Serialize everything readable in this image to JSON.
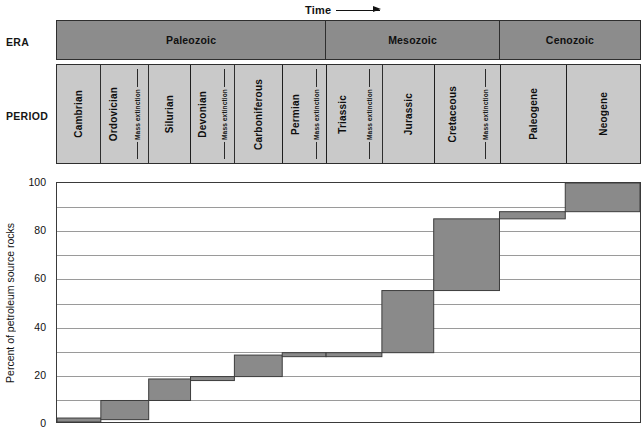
{
  "time_arrow": {
    "label": "Time",
    "icon": "right-arrow-icon"
  },
  "rows": {
    "era_label": "ERA",
    "period_label": "PERIOD"
  },
  "eras": [
    {
      "name": "Paleozoic",
      "span": 6
    },
    {
      "name": "Mesozoic",
      "span": 3
    },
    {
      "name": "Cenozoic",
      "span": 2
    }
  ],
  "periods": [
    {
      "name": "Cambrian",
      "mass_extinction": false
    },
    {
      "name": "Ordovician",
      "mass_extinction": true
    },
    {
      "name": "Silurian",
      "mass_extinction": false
    },
    {
      "name": "Devonian",
      "mass_extinction": true
    },
    {
      "name": "Carboniferous",
      "mass_extinction": false
    },
    {
      "name": "Permian",
      "mass_extinction": true
    },
    {
      "name": "Triassic",
      "mass_extinction": true
    },
    {
      "name": "Jurassic",
      "mass_extinction": false
    },
    {
      "name": "Cretaceous",
      "mass_extinction": true
    },
    {
      "name": "Paleogene",
      "mass_extinction": false
    },
    {
      "name": "Neogene",
      "mass_extinction": false
    }
  ],
  "mass_extinction_label": "Mass extinction",
  "colors": {
    "era_band": "#8c8c8c",
    "period_band": "#c9c9c9",
    "step_fill": "#8a8a8a",
    "step_stroke": "#3c3c3c",
    "gridline": "#9a9a9a",
    "axis": "#3a3a3a"
  },
  "chart_data": {
    "type": "bar",
    "title": "",
    "xlabel": "",
    "ylabel": "Percent of petroleum source rocks",
    "ylim": [
      0,
      100
    ],
    "yticks": [
      0,
      20,
      40,
      60,
      80,
      100
    ],
    "gridlines": [
      0,
      10,
      20,
      30,
      40,
      50,
      60,
      70,
      80,
      90,
      100
    ],
    "grid": true,
    "legend": "none",
    "note": "Cumulative step plot: each period spans a horizontal band from its starting cumulative percent to its ending cumulative percent.",
    "categories": [
      "Cambrian",
      "Ordovician",
      "Silurian",
      "Devonian",
      "Carboniferous",
      "Permian",
      "Triassic",
      "Jurassic",
      "Cretaceous",
      "Paleogene",
      "Neogene"
    ],
    "cumulative_start": [
      0,
      1,
      9,
      18,
      19,
      28,
      29,
      29,
      55,
      58,
      88
    ],
    "cumulative_end": [
      1,
      9,
      18,
      19,
      28,
      29,
      29,
      55,
      58,
      88,
      100
    ],
    "values": [
      1,
      8,
      9,
      1,
      9,
      1,
      0,
      26,
      3,
      30,
      12
    ],
    "steps": [
      {
        "period": "Cambrian",
        "from": 0,
        "to": 1
      },
      {
        "period": "Ordovician",
        "from": 1,
        "to": 9
      },
      {
        "period": "Silurian",
        "from": 9,
        "to": 18
      },
      {
        "period": "Devonian",
        "from": 18,
        "to": 19
      },
      {
        "period": "Carboniferous",
        "from": 19,
        "to": 28
      },
      {
        "period": "Permian",
        "from": 28,
        "to": 29
      },
      {
        "period": "Triassic",
        "from": 29,
        "to": 29
      },
      {
        "period": "Jurassic",
        "from": 29,
        "to": 55
      },
      {
        "period": "Cretaceous",
        "from": 55,
        "to": 85
      },
      {
        "period": "Paleogene",
        "from": 85,
        "to": 88
      },
      {
        "period": "Neogene",
        "from": 88,
        "to": 100
      }
    ]
  }
}
